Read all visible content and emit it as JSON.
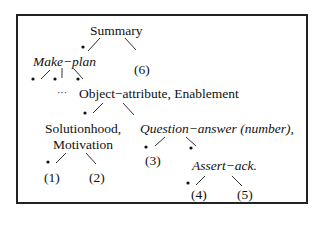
{
  "diagram": {
    "type": "tree",
    "nodes": {
      "summary": "Summary",
      "make_plan": "Make−plan",
      "six": "(6)",
      "ellipsis": "···",
      "object_attribute": "Object−attribute, Enablement",
      "solutionhood_1": "Solutionhood,",
      "solutionhood_2": "Motivation",
      "question_answer": "Question−answer (number),",
      "one": "(1)",
      "two": "(2)",
      "three": "(3)",
      "assert_ack": "Assert−ack.",
      "four": "(4)",
      "five": "(5)"
    },
    "edges": [
      {
        "from": "Summary",
        "to": "Make-plan",
        "nucleus": true
      },
      {
        "from": "Summary",
        "to": "(6)",
        "nucleus": false
      },
      {
        "from": "Make-plan",
        "to": "child-1",
        "nucleus": true
      },
      {
        "from": "Make-plan",
        "to": "child-2",
        "nucleus": true
      },
      {
        "from": "Make-plan",
        "to": "Object-attribute, Enablement",
        "nucleus": true
      },
      {
        "from": "Object-attribute, Enablement",
        "to": "Solutionhood, Motivation",
        "nucleus": true
      },
      {
        "from": "Object-attribute, Enablement",
        "to": "Question-answer (number),",
        "nucleus": false
      },
      {
        "from": "Solutionhood, Motivation",
        "to": "(1)",
        "nucleus": true
      },
      {
        "from": "Solutionhood, Motivation",
        "to": "(2)",
        "nucleus": false
      },
      {
        "from": "Question-answer (number),",
        "to": "(3)",
        "nucleus": true
      },
      {
        "from": "Question-answer (number),",
        "to": "Assert-ack.",
        "nucleus": true
      },
      {
        "from": "Assert-ack.",
        "to": "(4)",
        "nucleus": true
      },
      {
        "from": "Assert-ack.",
        "to": "(5)",
        "nucleus": false
      }
    ],
    "nucleus_marker": "*"
  }
}
